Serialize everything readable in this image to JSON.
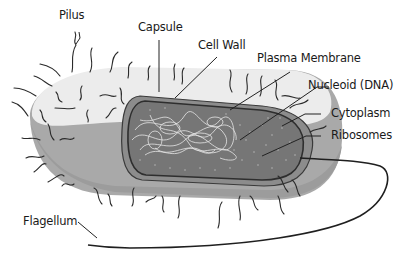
{
  "labels": {
    "pilus": "Pilus",
    "capsule": "Capsule",
    "cell_wall": "Cell Wall",
    "plasma_membrane": "Plasma Membrane",
    "nucleoid": "Nucleoid (DNA)",
    "cytoplasm": "Cytoplasm",
    "ribosomes": "Ribosomes",
    "flagellum": "Flagellum"
  },
  "colors": {
    "capsule_top": "#eeeeee",
    "capsule_side": "#a8a8a8",
    "cell_wall": "#8a8a8a",
    "cytoplasm": "#7a7a7a",
    "membrane_outline": "#333333",
    "dna_strands": "#e8e8e8",
    "ribosome_dots": "#9a9a9a",
    "lines": "#222222"
  }
}
